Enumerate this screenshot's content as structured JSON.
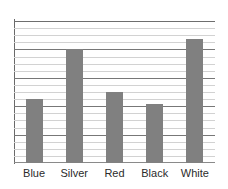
{
  "chart_data": {
    "type": "bar",
    "title": "",
    "subtitle": "",
    "xlabel": "",
    "ylabel": "",
    "categories": [
      "Blue",
      "Silver",
      "Red",
      "Black",
      "White"
    ],
    "values": [
      9,
      16,
      10,
      8.3,
      17.5
    ],
    "ylim": [
      0,
      20
    ],
    "xlim": [
      0,
      5
    ],
    "grid": true,
    "grid_orientation": "horizontal",
    "minor_gridline_interval": 1,
    "major_gridline_interval": 4,
    "legend": false,
    "legend_position": "none",
    "y_tick_labels": [],
    "x_tick_labels": [
      "Blue",
      "Silver",
      "Red",
      "Black",
      "White"
    ],
    "series": [
      {
        "name": "",
        "values": [
          9,
          16,
          10,
          8.3,
          17.5
        ],
        "color": "#808080"
      }
    ],
    "annotations": []
  },
  "style": {
    "bar_color": "#808080",
    "minor_gridline_color": "#d2d2d2",
    "major_gridline_color": "#777777",
    "axis_color": "#6a6a6a",
    "background": "#ffffff",
    "label_color": "#2b2b2b"
  },
  "labels": {
    "cat_0": "Blue",
    "cat_1": "Silver",
    "cat_2": "Red",
    "cat_3": "Black",
    "cat_4": "White"
  }
}
